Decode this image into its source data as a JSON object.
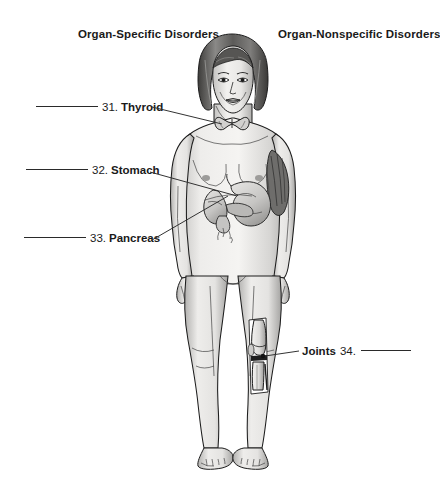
{
  "figure": {
    "headings": {
      "left": "Organ-Specific Disorders",
      "right": "Organ-Nonspecific Disorders"
    },
    "callouts": [
      {
        "id": "thyroid",
        "number": "31.",
        "organ": "Thyroid",
        "side": "left",
        "blank": ""
      },
      {
        "id": "stomach",
        "number": "32.",
        "organ": "Stomach",
        "side": "left",
        "blank": ""
      },
      {
        "id": "pancreas",
        "number": "33.",
        "organ": "Pancreas",
        "side": "left",
        "blank": ""
      },
      {
        "id": "joints",
        "number": "34.",
        "organ": "Joints",
        "side": "right",
        "blank": ""
      }
    ],
    "labels": {
      "thyroid_number": "31.",
      "thyroid_organ": "Thyroid",
      "stomach_number": "32.",
      "stomach_organ": "Stomach",
      "pancreas_number": "33.",
      "pancreas_organ": "Pancreas",
      "joints_organ": "Joints",
      "joints_number": "34."
    },
    "colors": {
      "background": "#ffffff",
      "text": "#1a1a1a",
      "line": "#333333",
      "skin": "#f0efed",
      "outline": "#1c1c1c",
      "organ": "#dcdbd9",
      "bone": "#eceae7",
      "hair": "#4a4a4a"
    },
    "illustration": {
      "subject": "female-anatomical-figure",
      "view": "anterior-full-body",
      "highlighted_structures": [
        "thyroid-gland",
        "stomach",
        "pancreas",
        "knee-joint",
        "shoulder-muscle"
      ]
    }
  }
}
